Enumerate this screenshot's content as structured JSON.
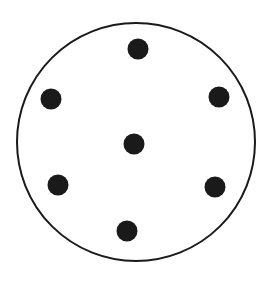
{
  "diagram": {
    "type": "dots-in-circle",
    "background": "#ffffff",
    "stroke_color": "#1a1a1a",
    "dot_color": "#1a1a1a",
    "outer_circle": {
      "cx": 136,
      "cy": 142,
      "r": 119,
      "stroke_width": 2
    },
    "dot_radius": 10.5,
    "dot_count": 7,
    "dots": [
      {
        "name": "top",
        "cx": 138,
        "cy": 49
      },
      {
        "name": "upper-left",
        "cx": 51,
        "cy": 99
      },
      {
        "name": "upper-right",
        "cx": 219,
        "cy": 97
      },
      {
        "name": "center",
        "cx": 134,
        "cy": 144
      },
      {
        "name": "lower-left",
        "cx": 58,
        "cy": 185
      },
      {
        "name": "lower-right",
        "cx": 215,
        "cy": 187
      },
      {
        "name": "bottom",
        "cx": 127,
        "cy": 231
      }
    ]
  }
}
